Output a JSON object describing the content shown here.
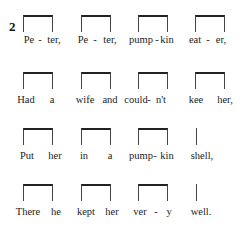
{
  "verse_number": "2",
  "lines": [
    {
      "text": "Peter, Peter, pumpkin eater,",
      "rhythm": [
        "pair",
        "pair",
        "pair",
        "pair"
      ],
      "syllables": [
        {
          "t": "Pe",
          "x": 29
        },
        {
          "t": "-",
          "x": 40
        },
        {
          "t": "ter,",
          "x": 54
        },
        {
          "t": "Pe",
          "x": 83
        },
        {
          "t": "-",
          "x": 95
        },
        {
          "t": "ter,",
          "x": 110
        },
        {
          "t": "pump",
          "x": 141
        },
        {
          "t": "-",
          "x": 157
        },
        {
          "t": "kin",
          "x": 167
        },
        {
          "t": "eat",
          "x": 195
        },
        {
          "t": "-",
          "x": 208
        },
        {
          "t": "er,",
          "x": 221
        }
      ]
    },
    {
      "text": "Had a wife and couldn't kee her,",
      "rhythm": [
        "pair",
        "pair",
        "pair",
        "pair"
      ],
      "syllables": [
        {
          "t": "Had",
          "x": 26
        },
        {
          "t": "a",
          "x": 52
        },
        {
          "t": "wife",
          "x": 85
        },
        {
          "t": "and",
          "x": 110
        },
        {
          "t": "could",
          "x": 136
        },
        {
          "t": "-",
          "x": 149
        },
        {
          "t": "n't",
          "x": 161
        },
        {
          "t": "kee",
          "x": 196
        },
        {
          "t": "her,",
          "x": 225
        }
      ]
    },
    {
      "text": "Put her in a pumpkin shell,",
      "rhythm": [
        "pair",
        "pair",
        "pair",
        "single"
      ],
      "syllables": [
        {
          "t": "Put",
          "x": 27
        },
        {
          "t": "her",
          "x": 55
        },
        {
          "t": "in",
          "x": 84
        },
        {
          "t": "a",
          "x": 110
        },
        {
          "t": "pump",
          "x": 141
        },
        {
          "t": "-",
          "x": 155
        },
        {
          "t": "kin",
          "x": 167
        },
        {
          "t": "shell,",
          "x": 202
        }
      ]
    },
    {
      "text": "There he kept her very well.",
      "rhythm": [
        "pair",
        "pair",
        "pair",
        "single"
      ],
      "syllables": [
        {
          "t": "There",
          "x": 28
        },
        {
          "t": "he",
          "x": 56
        },
        {
          "t": "kept",
          "x": 86
        },
        {
          "t": "her",
          "x": 112
        },
        {
          "t": "ver",
          "x": 140
        },
        {
          "t": "-",
          "x": 156
        },
        {
          "t": "y",
          "x": 169
        },
        {
          "t": "well.",
          "x": 201
        }
      ]
    }
  ],
  "colors": {
    "ink": "#222222",
    "background": "#ffffff"
  }
}
